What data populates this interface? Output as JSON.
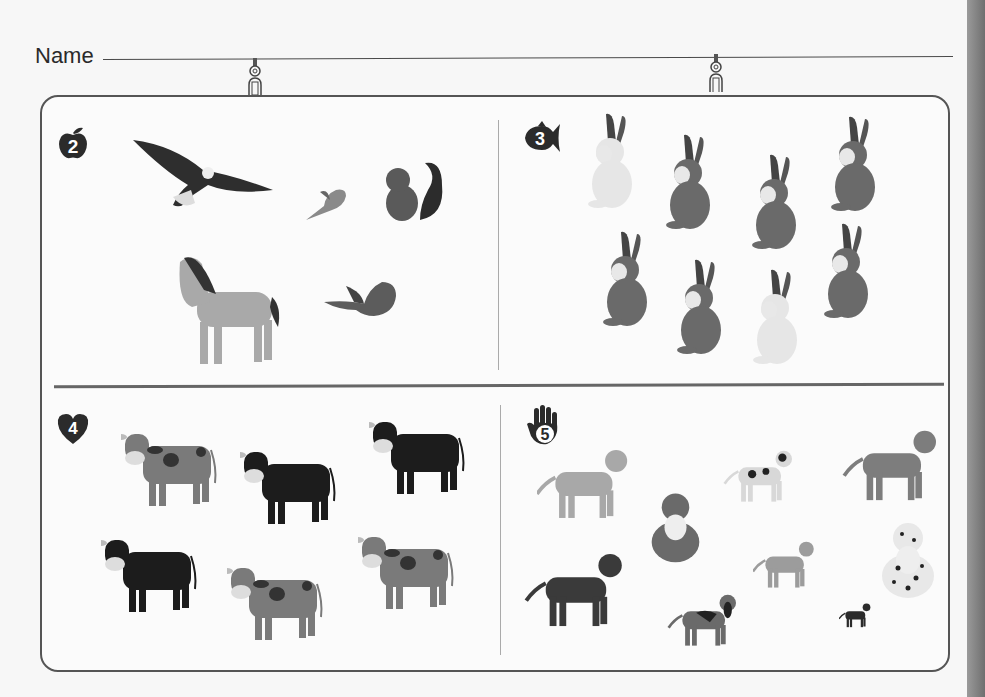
{
  "worksheet": {
    "name_label": "Name",
    "name_field_value": ""
  },
  "colors": {
    "frame_border": "#555555",
    "divider": "#666666",
    "badge": "#2b2b2b",
    "page": "#f7f7f7"
  },
  "sections": [
    {
      "number": "2",
      "badge_shape": "apple",
      "animals": [
        {
          "kind": "eagle",
          "x": 133,
          "y": 135,
          "w": 140,
          "h": 75,
          "shade": "#2e2e2e"
        },
        {
          "kind": "small-bird",
          "x": 306,
          "y": 178,
          "w": 45,
          "h": 45,
          "shade": "#8a8a8a"
        },
        {
          "kind": "squirrel",
          "x": 380,
          "y": 155,
          "w": 65,
          "h": 70,
          "shade": "#5a5a5a"
        },
        {
          "kind": "horse",
          "x": 172,
          "y": 252,
          "w": 115,
          "h": 115,
          "shade": "#a9a9a9"
        },
        {
          "kind": "robin",
          "x": 324,
          "y": 274,
          "w": 75,
          "h": 50,
          "shade": "#5c5c5c"
        }
      ]
    },
    {
      "number": "3",
      "badge_shape": "fish",
      "animals": [
        {
          "kind": "rabbit",
          "x": 584,
          "y": 112,
          "w": 50,
          "h": 98,
          "shade": "#e6e6e6"
        },
        {
          "kind": "rabbit",
          "x": 662,
          "y": 133,
          "w": 50,
          "h": 98,
          "shade": "#6a6a6a"
        },
        {
          "kind": "rabbit",
          "x": 748,
          "y": 153,
          "w": 50,
          "h": 98,
          "shade": "#6a6a6a"
        },
        {
          "kind": "rabbit",
          "x": 827,
          "y": 115,
          "w": 50,
          "h": 98,
          "shade": "#6a6a6a"
        },
        {
          "kind": "rabbit",
          "x": 599,
          "y": 230,
          "w": 50,
          "h": 98,
          "shade": "#6a6a6a"
        },
        {
          "kind": "rabbit",
          "x": 673,
          "y": 258,
          "w": 50,
          "h": 98,
          "shade": "#6a6a6a"
        },
        {
          "kind": "rabbit",
          "x": 749,
          "y": 268,
          "w": 50,
          "h": 98,
          "shade": "#e6e6e6"
        },
        {
          "kind": "rabbit",
          "x": 820,
          "y": 222,
          "w": 50,
          "h": 98,
          "shade": "#6a6a6a"
        }
      ]
    },
    {
      "number": "4",
      "badge_shape": "heart",
      "animals": [
        {
          "kind": "cow",
          "x": 121,
          "y": 428,
          "w": 98,
          "h": 80,
          "shade": "#7a7a7a",
          "spots": true
        },
        {
          "kind": "cow",
          "x": 240,
          "y": 446,
          "w": 98,
          "h": 80,
          "shade": "#1c1c1c",
          "spots": false
        },
        {
          "kind": "cow",
          "x": 369,
          "y": 416,
          "w": 98,
          "h": 80,
          "shade": "#1c1c1c",
          "spots": false
        },
        {
          "kind": "cow",
          "x": 101,
          "y": 534,
          "w": 98,
          "h": 80,
          "shade": "#1c1c1c",
          "spots": false
        },
        {
          "kind": "cow",
          "x": 227,
          "y": 562,
          "w": 98,
          "h": 80,
          "shade": "#7a7a7a",
          "spots": true
        },
        {
          "kind": "cow",
          "x": 358,
          "y": 531,
          "w": 98,
          "h": 80,
          "shade": "#7a7a7a",
          "spots": true
        }
      ]
    },
    {
      "number": "5",
      "badge_shape": "hand",
      "animals": [
        {
          "kind": "labrador",
          "x": 537,
          "y": 443,
          "w": 92,
          "h": 80,
          "shade": "#a8a8a8"
        },
        {
          "kind": "terrier",
          "x": 719,
          "y": 448,
          "w": 80,
          "h": 55,
          "shade": "#d8d8d8"
        },
        {
          "kind": "setter",
          "x": 838,
          "y": 427,
          "w": 106,
          "h": 75,
          "shade": "#7d7d7d"
        },
        {
          "kind": "collie",
          "x": 648,
          "y": 488,
          "w": 55,
          "h": 75,
          "shade": "#6a6a6a"
        },
        {
          "kind": "poodle",
          "x": 753,
          "y": 525,
          "w": 62,
          "h": 78,
          "shade": "#9c9c9c"
        },
        {
          "kind": "dalmatian",
          "x": 878,
          "y": 518,
          "w": 60,
          "h": 80,
          "shade": "#e8e8e8"
        },
        {
          "kind": "spaniel",
          "x": 521,
          "y": 550,
          "w": 108,
          "h": 78,
          "shade": "#3a3a3a"
        },
        {
          "kind": "basset",
          "x": 664,
          "y": 592,
          "w": 78,
          "h": 55,
          "shade": "#6a6a6a"
        },
        {
          "kind": "chihuahua",
          "x": 839,
          "y": 597,
          "w": 32,
          "h": 36,
          "shade": "#2b2b2b"
        }
      ]
    }
  ]
}
